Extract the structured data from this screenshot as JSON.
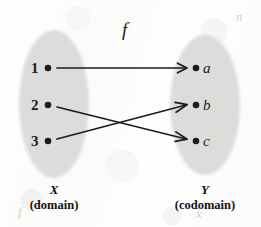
{
  "figure": {
    "kind": "function-mapping-diagram",
    "map_label": "f",
    "colors": {
      "set_fill": "#dcdcda",
      "ink": "#1b1b1b",
      "paper": "#fdfdfc"
    },
    "domain_set": {
      "name": "X",
      "role": "(domain)",
      "elements": [
        {
          "label": "1"
        },
        {
          "label": "2"
        },
        {
          "label": "3"
        }
      ]
    },
    "codomain_set": {
      "name": "Y",
      "role": "(codomain)",
      "elements": [
        {
          "label": "a"
        },
        {
          "label": "b"
        },
        {
          "label": "c"
        }
      ]
    },
    "mappings": [
      {
        "from": "1",
        "to": "a"
      },
      {
        "from": "2",
        "to": "c"
      },
      {
        "from": "3",
        "to": "b"
      }
    ],
    "ghost_marks": [
      {
        "text": "f"
      },
      {
        "text": "x"
      },
      {
        "text": "n"
      }
    ]
  }
}
